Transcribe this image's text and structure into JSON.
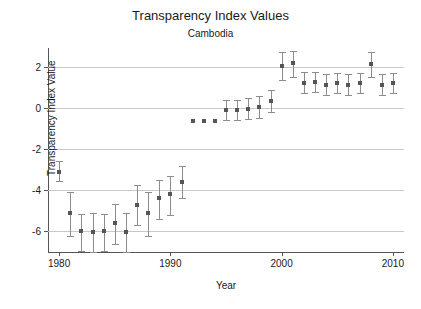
{
  "chart_data": {
    "type": "scatter",
    "title": "Transparency Index Values",
    "subtitle": "Cambodia",
    "xlabel": "Year",
    "ylabel": "Transparency Index Value",
    "xlim": [
      1979,
      2011
    ],
    "ylim": [
      -7.0,
      2.9
    ],
    "xticks": [
      1980,
      1990,
      2000,
      2010
    ],
    "yticks": [
      2,
      0,
      -2,
      -4,
      -6
    ],
    "grid": true,
    "legend": "none",
    "series_name": "Transparency Index Value",
    "point_color": "#555555",
    "errorbar_color": "#8c8c8c",
    "x": [
      1980,
      1981,
      1982,
      1983,
      1984,
      1985,
      1986,
      1987,
      1988,
      1989,
      1990,
      1991,
      1992,
      1993,
      1994,
      1995,
      1996,
      1997,
      1998,
      1999,
      2000,
      2001,
      2002,
      2003,
      2004,
      2005,
      2006,
      2007,
      2008,
      2009,
      2010
    ],
    "values": [
      -3.1,
      -5.1,
      -6.0,
      -6.05,
      -6.0,
      -5.6,
      -6.05,
      -4.7,
      -5.1,
      -4.4,
      -4.2,
      -3.6,
      -0.65,
      -0.65,
      -0.65,
      -0.1,
      -0.1,
      -0.05,
      0.05,
      0.35,
      2.05,
      2.15,
      1.2,
      1.25,
      1.1,
      1.2,
      1.1,
      1.2,
      2.1,
      1.1,
      1.2
    ],
    "err_low": [
      -3.55,
      -6.2,
      -6.95,
      -7.0,
      -6.95,
      -6.6,
      -7.0,
      -5.7,
      -6.2,
      -5.4,
      -5.2,
      -4.4,
      null,
      null,
      null,
      -0.6,
      -0.6,
      -0.55,
      -0.5,
      -0.2,
      1.35,
      1.5,
      0.7,
      0.75,
      0.6,
      0.7,
      0.6,
      0.7,
      1.5,
      0.6,
      0.7
    ],
    "err_high": [
      -2.6,
      -4.1,
      -5.15,
      -5.1,
      -5.15,
      -4.65,
      -5.1,
      -3.75,
      -4.1,
      -3.5,
      -3.3,
      -2.85,
      null,
      null,
      null,
      0.4,
      0.4,
      0.45,
      0.55,
      0.85,
      2.7,
      2.75,
      1.75,
      1.75,
      1.65,
      1.7,
      1.65,
      1.7,
      2.7,
      1.65,
      1.7
    ]
  }
}
